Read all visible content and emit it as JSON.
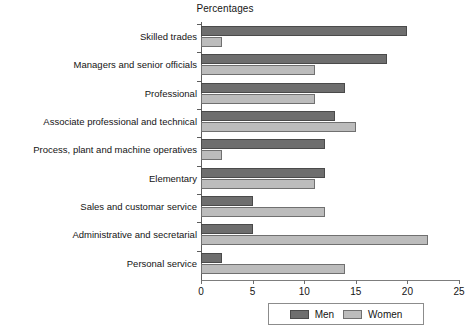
{
  "chart_data": {
    "type": "bar",
    "orientation": "horizontal",
    "title": "Percentages",
    "xlabel": "",
    "ylabel": "",
    "xlim": [
      0,
      25
    ],
    "xticks": [
      0,
      5,
      10,
      15,
      20,
      25
    ],
    "grid": false,
    "legend_position": "bottom",
    "categories": [
      "Skilled trades",
      "Managers and senior officials",
      "Professional",
      "Associate professional and technical",
      "Process, plant and machine operatives",
      "Elementary",
      "Sales and customar service",
      "Administrative and secretarial",
      "Personal service"
    ],
    "series": [
      {
        "name": "Men",
        "color": "#6e6e6e",
        "values": [
          20,
          18,
          14,
          13,
          12,
          12,
          5,
          5,
          2
        ]
      },
      {
        "name": "Women",
        "color": "#bcbcbc",
        "values": [
          2,
          11,
          11,
          15,
          2,
          11,
          12,
          22,
          14
        ]
      }
    ]
  },
  "legend": {
    "items": [
      {
        "label": "Men"
      },
      {
        "label": "Women"
      }
    ]
  }
}
